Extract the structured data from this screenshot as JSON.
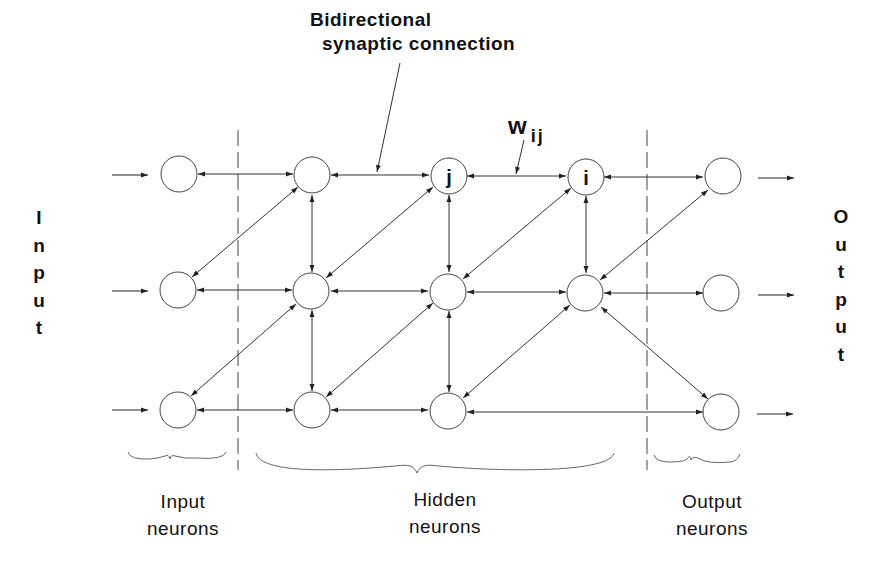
{
  "diagram": {
    "title_line1": "Bidirectional",
    "title_line2": "synaptic connection",
    "weight_label": "w",
    "weight_subscript": "ij",
    "side_labels": {
      "input": [
        "I",
        "n",
        "p",
        "u",
        "t"
      ],
      "output": [
        "O",
        "u",
        "t",
        "p",
        "u",
        "t"
      ]
    },
    "groups": [
      {
        "id": "input",
        "line1": "Input",
        "line2": "neurons"
      },
      {
        "id": "hidden",
        "line1": "Hidden",
        "line2": "neurons"
      },
      {
        "id": "output",
        "line1": "Output",
        "line2": "neurons"
      }
    ],
    "nodes": [
      {
        "id": "in1",
        "layer": "input",
        "label": ""
      },
      {
        "id": "in2",
        "layer": "input",
        "label": ""
      },
      {
        "id": "in3",
        "layer": "input",
        "label": ""
      },
      {
        "id": "h11",
        "layer": "hidden",
        "label": ""
      },
      {
        "id": "h12",
        "layer": "hidden",
        "label": ""
      },
      {
        "id": "h13",
        "layer": "hidden",
        "label": ""
      },
      {
        "id": "h21",
        "layer": "hidden",
        "label": "j"
      },
      {
        "id": "h22",
        "layer": "hidden",
        "label": ""
      },
      {
        "id": "h23",
        "layer": "hidden",
        "label": ""
      },
      {
        "id": "h31",
        "layer": "hidden",
        "label": "i"
      },
      {
        "id": "h32",
        "layer": "hidden",
        "label": ""
      },
      {
        "id": "out1",
        "layer": "output",
        "label": ""
      },
      {
        "id": "out2",
        "layer": "output",
        "label": ""
      },
      {
        "id": "out3",
        "layer": "output",
        "label": ""
      }
    ],
    "edges_bidirectional": [
      [
        "in1",
        "h11"
      ],
      [
        "in2",
        "h12"
      ],
      [
        "in3",
        "h13"
      ],
      [
        "in2",
        "h11"
      ],
      [
        "in3",
        "h12"
      ],
      [
        "h11",
        "h21"
      ],
      [
        "h21",
        "h31"
      ],
      [
        "h31",
        "out1"
      ],
      [
        "h12",
        "h22"
      ],
      [
        "h22",
        "h32"
      ],
      [
        "h32",
        "out2"
      ],
      [
        "h13",
        "h23"
      ],
      [
        "h23",
        "out3"
      ],
      [
        "h11",
        "h12"
      ],
      [
        "h12",
        "h13"
      ],
      [
        "h21",
        "h22"
      ],
      [
        "h22",
        "h23"
      ],
      [
        "h31",
        "h32"
      ],
      [
        "h12",
        "h21"
      ],
      [
        "h13",
        "h22"
      ],
      [
        "h22",
        "h31"
      ],
      [
        "h23",
        "h32"
      ],
      [
        "h32",
        "out1"
      ],
      [
        "h32",
        "out3"
      ]
    ],
    "external_arrows": {
      "inputs": 3,
      "outputs": 3
    }
  }
}
